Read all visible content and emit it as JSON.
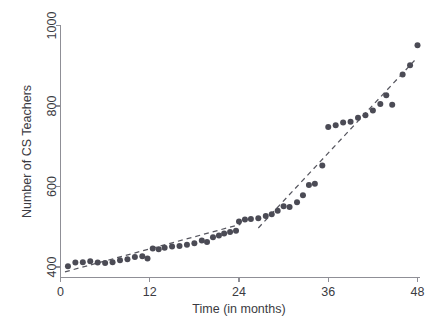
{
  "chart_data": {
    "type": "scatter",
    "title": "",
    "xlabel": "Time (in months)",
    "ylabel": "Number of CS Teachers",
    "xlim": [
      0,
      48
    ],
    "ylim": [
      380,
      1000
    ],
    "grid": false,
    "legend": "none",
    "xticks": [
      0,
      12,
      24,
      36,
      48
    ],
    "xtick_labels": [
      "0",
      "12",
      "24",
      "36",
      "48"
    ],
    "yticks": [
      400,
      600,
      800,
      1000
    ],
    "ytick_labels": [
      "400",
      "600",
      "800",
      "1000"
    ],
    "series": [
      {
        "name": "Number of CS Teachers",
        "marker": "filled-circle",
        "color": "#4b4b55",
        "points": [
          {
            "x": 1,
            "y": 402
          },
          {
            "x": 2,
            "y": 411
          },
          {
            "x": 3,
            "y": 412
          },
          {
            "x": 4,
            "y": 414
          },
          {
            "x": 5,
            "y": 411
          },
          {
            "x": 6,
            "y": 410
          },
          {
            "x": 7,
            "y": 412
          },
          {
            "x": 8,
            "y": 417
          },
          {
            "x": 9,
            "y": 419
          },
          {
            "x": 10,
            "y": 425
          },
          {
            "x": 11,
            "y": 427
          },
          {
            "x": 11.7,
            "y": 421
          },
          {
            "x": 12.4,
            "y": 446
          },
          {
            "x": 13.2,
            "y": 444
          },
          {
            "x": 14,
            "y": 448
          },
          {
            "x": 15,
            "y": 451
          },
          {
            "x": 16,
            "y": 452
          },
          {
            "x": 17,
            "y": 455
          },
          {
            "x": 18,
            "y": 459
          },
          {
            "x": 19,
            "y": 466
          },
          {
            "x": 19.7,
            "y": 462
          },
          {
            "x": 20.5,
            "y": 474
          },
          {
            "x": 21.3,
            "y": 478
          },
          {
            "x": 22,
            "y": 483
          },
          {
            "x": 22.8,
            "y": 487
          },
          {
            "x": 23.6,
            "y": 490
          },
          {
            "x": 24,
            "y": 513
          },
          {
            "x": 24.8,
            "y": 518
          },
          {
            "x": 25.6,
            "y": 519
          },
          {
            "x": 26.6,
            "y": 521
          },
          {
            "x": 27.6,
            "y": 527
          },
          {
            "x": 28.4,
            "y": 531
          },
          {
            "x": 29.2,
            "y": 540
          },
          {
            "x": 30,
            "y": 551
          },
          {
            "x": 30.8,
            "y": 549
          },
          {
            "x": 31.8,
            "y": 561
          },
          {
            "x": 32.6,
            "y": 578
          },
          {
            "x": 33.4,
            "y": 604
          },
          {
            "x": 34.2,
            "y": 607
          },
          {
            "x": 35.2,
            "y": 652
          },
          {
            "x": 36,
            "y": 748
          },
          {
            "x": 37,
            "y": 752
          },
          {
            "x": 38,
            "y": 759
          },
          {
            "x": 39,
            "y": 761
          },
          {
            "x": 40,
            "y": 771
          },
          {
            "x": 41,
            "y": 777
          },
          {
            "x": 42,
            "y": 789
          },
          {
            "x": 43,
            "y": 805
          },
          {
            "x": 43.8,
            "y": 827
          },
          {
            "x": 44.6,
            "y": 803
          },
          {
            "x": 46,
            "y": 878
          },
          {
            "x": 47,
            "y": 901
          },
          {
            "x": 48,
            "y": 951
          }
        ]
      }
    ],
    "trend_lines": [
      {
        "name": "segment-1",
        "style": "dashed",
        "color": "#56565f",
        "from": {
          "x": 0.6,
          "y": 388
        },
        "to": {
          "x": 24.2,
          "y": 506
        }
      },
      {
        "name": "segment-2",
        "style": "dashed",
        "color": "#56565f",
        "from": {
          "x": 26.6,
          "y": 497
        },
        "to": {
          "x": 47.6,
          "y": 913
        }
      }
    ],
    "annotations": []
  }
}
